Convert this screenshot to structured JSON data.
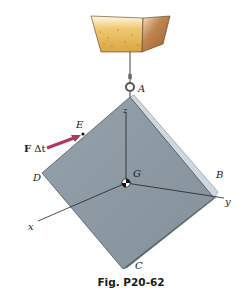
{
  "figure": {
    "caption": "Fig. P20-62",
    "points": {
      "A": "A",
      "B": "B",
      "C": "C",
      "D": "D",
      "E": "E",
      "G": "G"
    },
    "axes": {
      "x": "x",
      "y": "y",
      "z": "z"
    },
    "force_label_bold": "F",
    "force_label_rest": " Δt",
    "colors": {
      "plate_face": "#8e9ba5",
      "plate_edge": "#c9d3d9",
      "force_arrow": "#b0385e",
      "bucket_fill": "#e3b24a",
      "bucket_side": "#b57a3c"
    }
  }
}
